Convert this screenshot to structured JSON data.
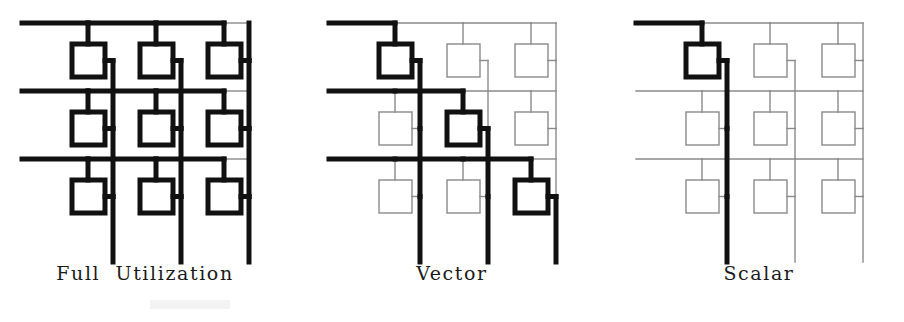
{
  "figure": {
    "type": "diagram",
    "panel_count": 3,
    "grid": {
      "rows": 3,
      "cols": 3,
      "cell_pitch_x": 68,
      "cell_pitch_y": 68,
      "box_size": 33,
      "bus_line_label": "horizontal row bus",
      "column_line_label": "vertical column line"
    },
    "colors": {
      "active_line": "#111111",
      "inactive_line": "#8a8a8a",
      "background": "#ffffff",
      "caption_text": "#1a1a1a"
    },
    "line_widths": {
      "active": 5,
      "inactive": 1.4
    },
    "panels": [
      {
        "id": "full-utilization",
        "caption": "Full  Utilization",
        "offset_x": 0,
        "active_cells": [
          {
            "row": 0,
            "col": 0
          },
          {
            "row": 0,
            "col": 1
          },
          {
            "row": 0,
            "col": 2
          },
          {
            "row": 1,
            "col": 0
          },
          {
            "row": 1,
            "col": 1
          },
          {
            "row": 1,
            "col": 2
          },
          {
            "row": 2,
            "col": 0
          },
          {
            "row": 2,
            "col": 1
          },
          {
            "row": 2,
            "col": 2
          }
        ],
        "active_count": 9
      },
      {
        "id": "vector",
        "caption": "Vector",
        "offset_x": 307,
        "active_cells": [
          {
            "row": 0,
            "col": 0
          },
          {
            "row": 1,
            "col": 1
          },
          {
            "row": 2,
            "col": 2
          }
        ],
        "active_count": 3
      },
      {
        "id": "scalar",
        "caption": "Scalar",
        "offset_x": 614,
        "active_cells": [
          {
            "row": 0,
            "col": 0
          }
        ],
        "active_count": 1
      }
    ]
  }
}
